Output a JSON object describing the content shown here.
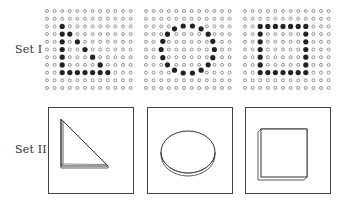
{
  "sets": [
    {
      "label": "Set I",
      "type": "dot-grids",
      "grids": [
        {
          "name": "triangle",
          "cols": 12,
          "rows": 11,
          "filled": [
            [
              2,
              2
            ],
            [
              3,
              2
            ],
            [
              3,
              3
            ],
            [
              4,
              2
            ],
            [
              4,
              4
            ],
            [
              5,
              2
            ],
            [
              5,
              5
            ],
            [
              6,
              2
            ],
            [
              6,
              6
            ],
            [
              7,
              2
            ],
            [
              7,
              7
            ],
            [
              8,
              2
            ],
            [
              8,
              3
            ],
            [
              8,
              4
            ],
            [
              8,
              5
            ],
            [
              8,
              6
            ],
            [
              8,
              7
            ],
            [
              8,
              8
            ]
          ]
        },
        {
          "name": "circle",
          "cols": 12,
          "rows": 11,
          "filled_offset": [
            [
              2,
              4.2
            ],
            [
              1.8,
              5.1
            ],
            [
              2,
              5.9
            ],
            [
              1.8,
              6.8
            ],
            [
              2.6,
              3.2
            ],
            [
              2.4,
              8.6
            ],
            [
              3.3,
              2.4
            ],
            [
              3.1,
              9.4
            ],
            [
              4.3,
              1.9
            ],
            [
              4.4,
              9.8
            ],
            [
              5.4,
              2.3
            ],
            [
              5.4,
              9.4
            ],
            [
              6.5,
              2.9
            ],
            [
              6.3,
              8.7
            ],
            [
              7.3,
              3.6
            ],
            [
              7.1,
              8.0
            ],
            [
              8.2,
              4.3
            ],
            [
              8.4,
              6.9
            ],
            [
              8.5,
              5.7
            ]
          ],
          "circle_cells": [
            [
              2,
              4
            ],
            [
              2,
              5
            ],
            [
              2,
              6
            ],
            [
              2,
              7
            ],
            [
              3,
              3
            ],
            [
              3,
              8
            ],
            [
              4,
              2
            ],
            [
              4,
              9
            ],
            [
              5,
              2
            ],
            [
              5,
              9
            ],
            [
              6,
              2
            ],
            [
              6,
              9
            ],
            [
              7,
              3
            ],
            [
              7,
              8
            ],
            [
              8,
              4
            ],
            [
              8,
              5
            ],
            [
              8,
              6
            ],
            [
              8,
              7
            ]
          ]
        },
        {
          "name": "square",
          "cols": 12,
          "rows": 11,
          "filled": [
            [
              2,
              2
            ],
            [
              2,
              3
            ],
            [
              2,
              4
            ],
            [
              2,
              5
            ],
            [
              2,
              6
            ],
            [
              2,
              7
            ],
            [
              2,
              8
            ],
            [
              3,
              2
            ],
            [
              3,
              8
            ],
            [
              4,
              2
            ],
            [
              4,
              8
            ],
            [
              5,
              2
            ],
            [
              5,
              8
            ],
            [
              6,
              2
            ],
            [
              6,
              8
            ],
            [
              7,
              2
            ],
            [
              7,
              8
            ],
            [
              8,
              2
            ],
            [
              8,
              3
            ],
            [
              8,
              4
            ],
            [
              8,
              5
            ],
            [
              8,
              6
            ],
            [
              8,
              7
            ],
            [
              8,
              8
            ]
          ]
        }
      ]
    },
    {
      "label": "Set II",
      "type": "solid-shapes",
      "shapes": [
        "triangle",
        "disc",
        "square"
      ]
    }
  ],
  "colors": {
    "ink": "#333333",
    "dot_empty": "#666666",
    "dot_filled": "#222222"
  }
}
